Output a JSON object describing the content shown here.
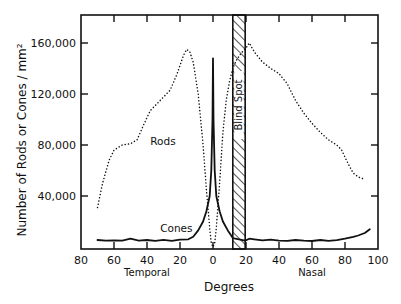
{
  "chart_data": {
    "type": "line",
    "title": "",
    "xlabel": "Degrees",
    "ylabel": "Number of Rods or Cones / mm²",
    "x_region_labels": [
      {
        "label": "Temporal",
        "at": -40
      },
      {
        "label": "Nasal",
        "at": 60
      }
    ],
    "xlim": [
      -80,
      100
    ],
    "ylim": [
      0,
      175000
    ],
    "x_ticks": [
      -80,
      -60,
      -40,
      -20,
      0,
      20,
      40,
      60,
      80,
      100
    ],
    "x_tick_labels": [
      "80",
      "60",
      "40",
      "20",
      "0",
      "20",
      "40",
      "60",
      "80",
      "100"
    ],
    "y_ticks": [
      40000,
      80000,
      120000,
      160000
    ],
    "y_tick_labels": [
      "40,000",
      "80,000",
      "120,000",
      "160,000"
    ],
    "grid": false,
    "legend": "inline labels",
    "annotations": [
      {
        "label": "Blind Spot",
        "x_range": [
          12,
          19.5
        ],
        "style": "hatched band"
      }
    ],
    "series": [
      {
        "name": "Rods",
        "style": "dotted",
        "label_at": [
          -38,
          80000
        ],
        "x": [
          -70,
          -67,
          -63,
          -60,
          -55,
          -50,
          -46,
          -42,
          -38,
          -32,
          -26,
          -22,
          -18,
          -16,
          -14,
          -12,
          -9,
          -6,
          -4,
          -2,
          -1,
          0,
          1,
          2,
          4,
          6,
          8,
          10,
          12,
          14,
          17,
          20,
          22,
          25,
          30,
          35,
          40,
          45,
          50,
          55,
          60,
          65,
          70,
          75,
          78,
          82,
          85,
          88,
          92
        ],
        "values": [
          31000,
          50000,
          68000,
          76000,
          80000,
          81000,
          84000,
          96000,
          107000,
          115000,
          123000,
          135000,
          150000,
          155000,
          153000,
          145000,
          120000,
          80000,
          45000,
          15000,
          3000,
          0,
          3000,
          15000,
          50000,
          90000,
          115000,
          130000,
          140000,
          146000,
          152000,
          156000,
          160000,
          153000,
          145000,
          140000,
          136000,
          128000,
          115000,
          105000,
          97000,
          90000,
          84000,
          80000,
          76000,
          65000,
          58000,
          55000,
          53000
        ]
      },
      {
        "name": "Cones",
        "style": "solid",
        "label_at": [
          -32,
          12000
        ],
        "x": [
          -70,
          -65,
          -60,
          -55,
          -50,
          -45,
          -40,
          -35,
          -30,
          -25,
          -20,
          -15,
          -12,
          -9,
          -6,
          -4,
          -2,
          -1,
          -0.3,
          0,
          0.3,
          1,
          2,
          4,
          6,
          9,
          11,
          12,
          19.5,
          22,
          25,
          30,
          35,
          40,
          45,
          50,
          55,
          60,
          65,
          70,
          75,
          80,
          85,
          88,
          92,
          95
        ],
        "values": [
          5500,
          5000,
          5200,
          5000,
          6500,
          5000,
          5500,
          4800,
          5600,
          4800,
          5800,
          6000,
          8000,
          13000,
          20000,
          28000,
          40000,
          60000,
          100000,
          148000,
          100000,
          60000,
          40000,
          28000,
          20000,
          13000,
          9000,
          7000,
          5000,
          6500,
          6000,
          5200,
          5800,
          5000,
          4800,
          5500,
          5000,
          4700,
          5500,
          4800,
          5300,
          6500,
          8000,
          9000,
          11000,
          14000
        ]
      }
    ]
  }
}
